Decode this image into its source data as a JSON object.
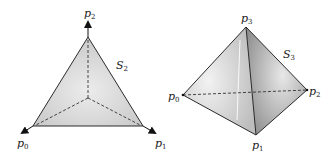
{
  "left_figure": {
    "name": "S_2",
    "label_main": "S",
    "label_sub": "2",
    "vertices": [
      {
        "main": "p",
        "sub": "0"
      },
      {
        "main": "p",
        "sub": "1"
      },
      {
        "main": "p",
        "sub": "2"
      }
    ]
  },
  "right_figure": {
    "name": "S_3",
    "label_main": "S",
    "label_sub": "3",
    "vertices": [
      {
        "main": "p",
        "sub": "0"
      },
      {
        "main": "p",
        "sub": "1"
      },
      {
        "main": "p",
        "sub": "2"
      },
      {
        "main": "p",
        "sub": "3"
      }
    ]
  },
  "colors": {
    "fill_light": "#e6e6e6",
    "fill_mid": "#cfcfcf",
    "fill_dark": "#9a9a9a",
    "stroke": "#2a2a2a"
  }
}
